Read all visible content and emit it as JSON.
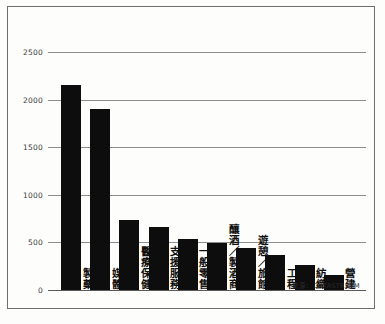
{
  "chart_data": {
    "type": "bar",
    "title": "",
    "subtitle": "",
    "xlabel": "",
    "ylabel": "",
    "ylim": [
      0,
      2500
    ],
    "yticks": [
      "0",
      "500",
      "1000",
      "1500",
      "2000",
      "2500"
    ],
    "ytick_values": [
      0,
      500,
      1000,
      1500,
      2000,
      2500
    ],
    "grid": true,
    "legend": "none",
    "orientation": "vertical",
    "bar_color": "#0d0d0d",
    "categories": [
      "製藥",
      "媒體",
      "醫療保健",
      "支援服務",
      "一般零售",
      "釀酒／製酒商",
      "遊憩／旅館",
      "工程",
      "紡織",
      "營建"
    ],
    "values": [
      2150,
      1900,
      740,
      660,
      540,
      490,
      440,
      370,
      260,
      160
    ],
    "source_note": "來源：DATASTREAM"
  }
}
